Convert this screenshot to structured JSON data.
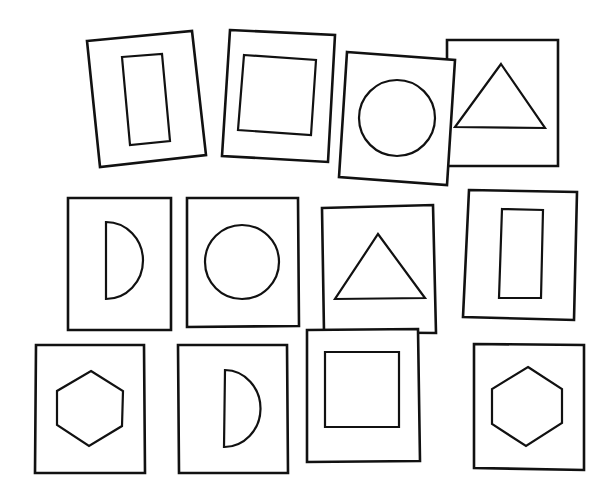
{
  "title": "Shape cards",
  "colors": {
    "background": "#ffffff",
    "ink": "#111111"
  },
  "cards": [
    {
      "id": 1,
      "row": 1,
      "shape": "tall-rectangle",
      "label": "Card with tall rectangle"
    },
    {
      "id": 2,
      "row": 1,
      "shape": "square",
      "label": "Card with square"
    },
    {
      "id": 3,
      "row": 1,
      "shape": "circle",
      "label": "Card with circle"
    },
    {
      "id": 4,
      "row": 1,
      "shape": "triangle",
      "label": "Card with triangle"
    },
    {
      "id": 5,
      "row": 2,
      "shape": "half-circle",
      "label": "Card with half circle"
    },
    {
      "id": 6,
      "row": 2,
      "shape": "circle",
      "label": "Card with circle"
    },
    {
      "id": 7,
      "row": 2,
      "shape": "triangle",
      "label": "Card with triangle"
    },
    {
      "id": 8,
      "row": 2,
      "shape": "tall-rectangle",
      "label": "Card with tall rectangle"
    },
    {
      "id": 9,
      "row": 3,
      "shape": "hexagon",
      "label": "Card with hexagon"
    },
    {
      "id": 10,
      "row": 3,
      "shape": "half-circle",
      "label": "Card with half circle"
    },
    {
      "id": 11,
      "row": 3,
      "shape": "square",
      "label": "Card with square"
    },
    {
      "id": 12,
      "row": 3,
      "shape": "hexagon",
      "label": "Card with hexagon"
    }
  ]
}
